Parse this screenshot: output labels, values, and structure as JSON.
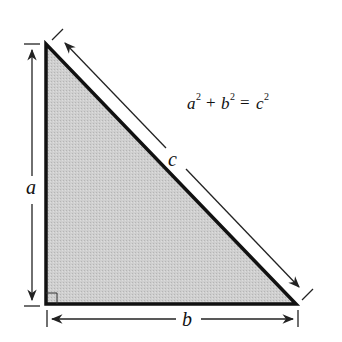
{
  "diagram": {
    "equation": {
      "a": "a",
      "b": "b",
      "c": "c",
      "exp": "2",
      "plus": "+",
      "equals": "="
    },
    "labels": {
      "side_a": "a",
      "side_b": "b",
      "side_c": "c"
    },
    "colors": {
      "fill": "#c8c8c8",
      "stroke": "#111111",
      "dim": "#222222"
    }
  }
}
